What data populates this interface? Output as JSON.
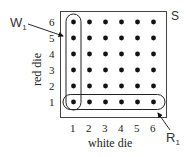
{
  "diagram": {
    "sample_space_label": "S",
    "x_axis_label": "white die",
    "y_axis_label": "red die",
    "x_ticks": [
      "1",
      "2",
      "3",
      "4",
      "5",
      "6"
    ],
    "y_ticks": [
      "1",
      "2",
      "3",
      "4",
      "5",
      "6"
    ],
    "grid": {
      "rows": 6,
      "cols": 6,
      "dot_color": "#111111"
    },
    "events": [
      {
        "label": "W",
        "subscript": "1",
        "description": "column where white die = 1"
      },
      {
        "label": "R",
        "subscript": "1",
        "description": "row where red die = 1"
      }
    ],
    "line_color": "#333333"
  }
}
